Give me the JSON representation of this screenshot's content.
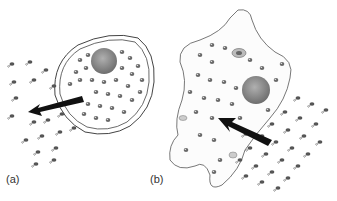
{
  "panels": [
    {
      "label": "(a)",
      "description": "Round cell with nucleus; particles exiting through membrane; arrow pointing left/outward"
    },
    {
      "label": "(b)",
      "description": "Amoeboid cell with nucleus and vacuoles; particles entering; arrow pointing up-left/inward"
    }
  ],
  "colors": {
    "outline": "#444444",
    "particle": "#6a6a6a",
    "nucleus": "#8a8a8a",
    "arrow": "#111111",
    "background": "#ffffff"
  }
}
